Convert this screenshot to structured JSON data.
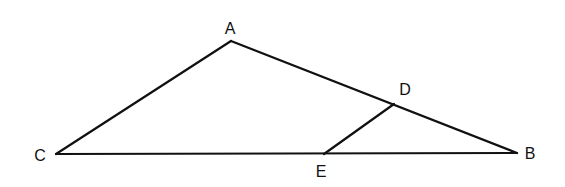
{
  "diagram": {
    "type": "triangle-with-segment",
    "points": {
      "A": {
        "label": "A",
        "x": 231,
        "y": 41,
        "label_x": 230,
        "label_y": 34
      },
      "B": {
        "label": "B",
        "x": 517,
        "y": 153,
        "label_x": 530,
        "label_y": 159
      },
      "C": {
        "label": "C",
        "x": 56,
        "y": 154,
        "label_x": 40,
        "label_y": 161
      },
      "D": {
        "label": "D",
        "x": 394,
        "y": 104,
        "label_x": 405,
        "label_y": 95
      },
      "E": {
        "label": "E",
        "x": 324,
        "y": 154,
        "label_x": 321,
        "label_y": 177
      }
    },
    "segments": [
      {
        "name": "AC",
        "from": "A",
        "to": "C"
      },
      {
        "name": "AB",
        "from": "A",
        "to": "B"
      },
      {
        "name": "CB",
        "from": "C",
        "to": "B"
      },
      {
        "name": "DE",
        "from": "D",
        "to": "E"
      }
    ],
    "line_color": "#111111"
  }
}
